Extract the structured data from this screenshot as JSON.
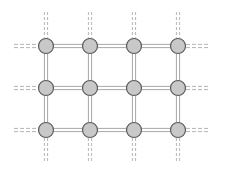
{
  "diagram": {
    "type": "grid-graph",
    "rows": 3,
    "cols": 4,
    "node_columns_x": [
      46,
      90,
      134,
      178
    ],
    "node_rows_y": [
      46,
      88,
      130
    ],
    "node_radius": 7.5,
    "colors": {
      "background": "#ffffff",
      "node_fill": "#c8c8c8",
      "node_stroke": "#5a5a5a",
      "edge": "#a8a8a8",
      "stub": "#b4b4b4"
    },
    "edge_style": "double-line",
    "stub_style": "double-dashed",
    "stubs": {
      "top": {
        "from": 12,
        "to": 38
      },
      "bottom": {
        "from": 138,
        "to": 162
      },
      "left": {
        "from": 14,
        "to": 38
      },
      "right": {
        "from": 186,
        "to": 209
      }
    }
  }
}
